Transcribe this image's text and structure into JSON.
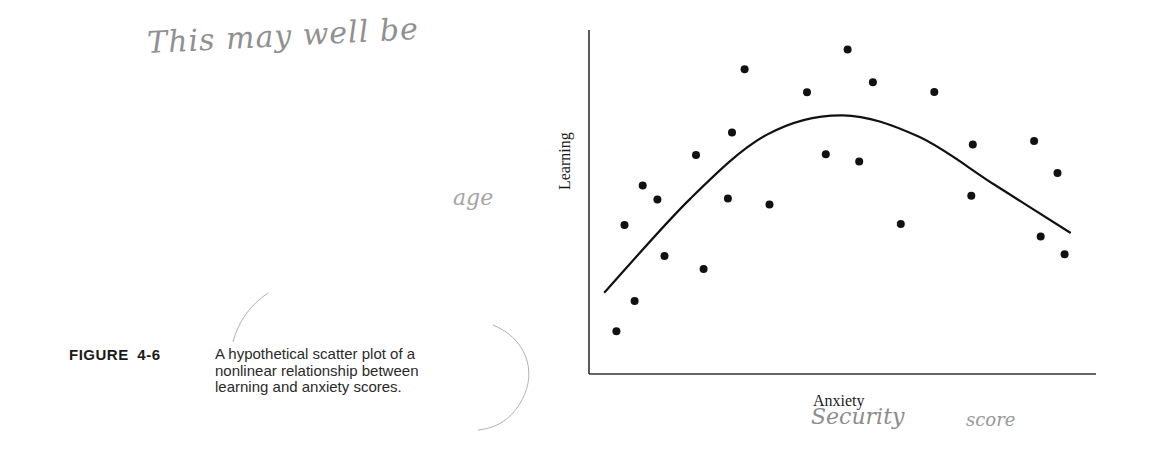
{
  "figure": {
    "label": "FIGURE 4-6",
    "caption_lines": [
      "A hypothetical scatter plot of a",
      "nonlinear relationship between",
      "learning and anxiety scores."
    ]
  },
  "annotations": {
    "top_note": "This may well be",
    "age_note": "age",
    "x_note_1": "Security",
    "x_note_2": "score"
  },
  "colors": {
    "ink": "#111111",
    "axis": "#333333",
    "pencil": "#8a8a8a"
  },
  "chart_data": {
    "type": "scatter",
    "title": "",
    "xlabel": "Anxiety",
    "ylabel": "Learning",
    "grid": false,
    "legend": "none",
    "xlim": [
      0,
      100
    ],
    "ylim": [
      0,
      100
    ],
    "ticks": "none",
    "note": "Hypothetical data; axes have no numeric ticks. Values are normalized 0-100 positions read from the plot.",
    "points": [
      {
        "x": 5.4,
        "y": 12.4
      },
      {
        "x": 7.0,
        "y": 43.3
      },
      {
        "x": 9.0,
        "y": 21.2
      },
      {
        "x": 10.6,
        "y": 54.8
      },
      {
        "x": 13.5,
        "y": 50.7
      },
      {
        "x": 14.9,
        "y": 34.3
      },
      {
        "x": 21.1,
        "y": 63.7
      },
      {
        "x": 22.6,
        "y": 30.5
      },
      {
        "x": 27.4,
        "y": 51.0
      },
      {
        "x": 28.2,
        "y": 70.2
      },
      {
        "x": 30.7,
        "y": 88.6
      },
      {
        "x": 35.6,
        "y": 49.3
      },
      {
        "x": 43.0,
        "y": 81.9
      },
      {
        "x": 46.7,
        "y": 63.9
      },
      {
        "x": 51.0,
        "y": 94.3
      },
      {
        "x": 53.3,
        "y": 61.8
      },
      {
        "x": 56.0,
        "y": 84.8
      },
      {
        "x": 61.5,
        "y": 43.6
      },
      {
        "x": 68.1,
        "y": 82.0
      },
      {
        "x": 75.4,
        "y": 51.8
      },
      {
        "x": 75.7,
        "y": 66.7
      },
      {
        "x": 87.8,
        "y": 67.7
      },
      {
        "x": 89.1,
        "y": 40.0
      },
      {
        "x": 92.4,
        "y": 58.4
      },
      {
        "x": 93.8,
        "y": 34.8
      }
    ],
    "fit_curve": {
      "type": "inverted-U (quadratic-like)",
      "points": [
        {
          "x": 3.0,
          "y": 23.6
        },
        {
          "x": 20.0,
          "y": 51.0
        },
        {
          "x": 35.0,
          "y": 69.5
        },
        {
          "x": 50.0,
          "y": 75.2
        },
        {
          "x": 65.0,
          "y": 69.0
        },
        {
          "x": 80.0,
          "y": 55.0
        },
        {
          "x": 95.0,
          "y": 41.0
        }
      ]
    }
  }
}
